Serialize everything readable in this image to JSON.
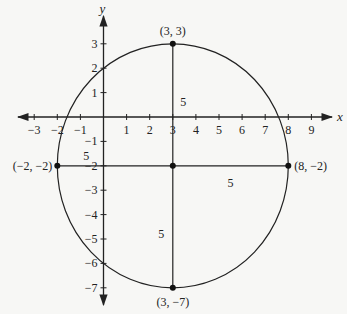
{
  "chart_data": {
    "type": "scatter",
    "title": "",
    "xlabel": "x",
    "ylabel": "y",
    "xlim": [
      -3.7,
      10.5
    ],
    "ylim": [
      -7.6,
      3.9
    ],
    "grid": false,
    "x_ticks": [
      -3,
      -2,
      -1,
      1,
      2,
      3,
      4,
      5,
      6,
      7,
      8,
      9
    ],
    "y_ticks": [
      3,
      2,
      1,
      -1,
      -2,
      -3,
      -4,
      -5,
      -6,
      -7
    ],
    "circle": {
      "center": [
        3,
        -2
      ],
      "radius": 5
    },
    "points": [
      {
        "x": 3,
        "y": 3,
        "label": "(3, 3)"
      },
      {
        "x": -2,
        "y": -2,
        "label": "(−2, −2)"
      },
      {
        "x": 8,
        "y": -2,
        "label": "(8, −2)"
      },
      {
        "x": 3,
        "y": -7,
        "label": "(3, −7)"
      },
      {
        "x": 3,
        "y": -2,
        "label": ""
      }
    ],
    "segments": [
      {
        "from": [
          3,
          3
        ],
        "to": [
          3,
          -7
        ]
      },
      {
        "from": [
          -2,
          -2
        ],
        "to": [
          8,
          -2
        ]
      }
    ],
    "annotations": [
      {
        "text": "5",
        "x": 3.45,
        "y": 0.6
      },
      {
        "text": "5",
        "x": -0.75,
        "y": -1.6
      },
      {
        "text": "5",
        "x": 5.5,
        "y": -2.7
      },
      {
        "text": "5",
        "x": 2.5,
        "y": -4.8
      }
    ]
  }
}
